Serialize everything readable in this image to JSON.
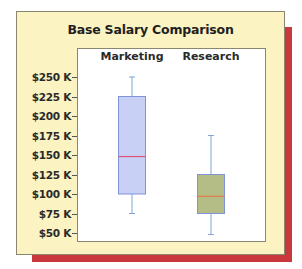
{
  "chart_data": {
    "type": "box",
    "title": "Base Salary Comparison",
    "xlabel": "",
    "ylabel": "",
    "categories": [
      "Marketing",
      "Research"
    ],
    "ylim": [
      50,
      250
    ],
    "yticks": [
      50,
      75,
      100,
      125,
      150,
      175,
      200,
      225,
      250
    ],
    "ytick_labels": [
      "$50 K",
      "$75 K",
      "$100 K",
      "$125 K",
      "$150 K",
      "$175 K",
      "$200 K",
      "$225 K",
      "$250 K"
    ],
    "units": "$K",
    "grid": false,
    "legend": null,
    "series": [
      {
        "name": "Marketing",
        "whisker_high": 250,
        "q3": 225,
        "median": 148,
        "q1": 100,
        "whisker_low": 75,
        "fill": "#c9d0f5",
        "stroke": "#7f93d6",
        "median_color": "#e0557a"
      },
      {
        "name": "Research",
        "whisker_high": 175,
        "q3": 125,
        "median": 97,
        "q1": 75,
        "whisker_low": 48,
        "fill": "#b5bd86",
        "stroke": "#7f93d6",
        "median_color": "#e07a4a"
      }
    ]
  },
  "colors": {
    "panel_bg": "#fbf3c2",
    "shadow": "#c8383d",
    "plot_bg": "#ffffff",
    "whisker": "#7fa6d6"
  }
}
